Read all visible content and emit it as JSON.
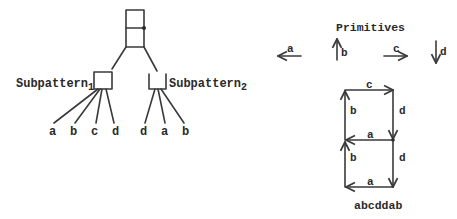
{
  "tree": {
    "root": {
      "shape": "split-box",
      "has_dot": true
    },
    "subpatterns": [
      {
        "label": "Subpattern",
        "subscript": "1",
        "shape": "closed-box",
        "children": [
          "a",
          "b",
          "c",
          "d"
        ]
      },
      {
        "label": "Subpattern",
        "subscript": "2",
        "shape": "open-box",
        "children": [
          "d",
          "a",
          "b"
        ]
      }
    ]
  },
  "primitives": {
    "title": "Primitives",
    "items": [
      {
        "label": "a",
        "direction": "left"
      },
      {
        "label": "b",
        "direction": "up"
      },
      {
        "label": "c",
        "direction": "right"
      },
      {
        "label": "d",
        "direction": "down"
      }
    ]
  },
  "figure": {
    "edges": [
      {
        "label": "c",
        "position": "top",
        "direction": "right"
      },
      {
        "label": "b",
        "position": "left-upper",
        "direction": "up"
      },
      {
        "label": "d",
        "position": "right-upper",
        "direction": "down"
      },
      {
        "label": "a",
        "position": "middle",
        "direction": "left"
      },
      {
        "label": "b",
        "position": "left-lower",
        "direction": "up"
      },
      {
        "label": "d",
        "position": "right-lower",
        "direction": "down"
      },
      {
        "label": "a",
        "position": "bottom",
        "direction": "left"
      }
    ],
    "caption": "abcddab"
  },
  "colors": {
    "ink": "#2a2a2a",
    "background": "#ffffff"
  }
}
